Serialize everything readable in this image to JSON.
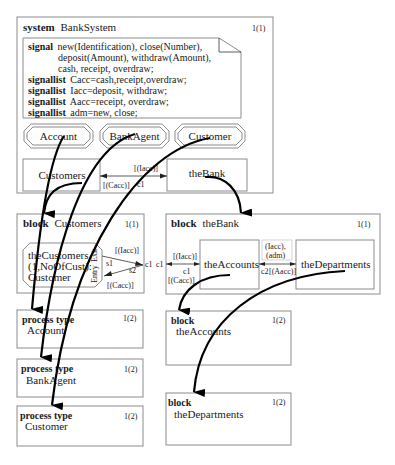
{
  "system": {
    "keyword": "system",
    "name": "BankSystem",
    "page": "1(1)",
    "signal_text": {
      "line1_kw": "signal",
      "line1": "new(Identification), close(Number),",
      "line2": "deposit(Amount), withdraw(Amount),",
      "line3": "cash, receipt, overdraw;",
      "line4_kw": "signallist",
      "line4": "Cacc=cash,receipt,overdraw;",
      "line5_kw": "signallist",
      "line5": "Iacc=deposit, withdraw;",
      "line6_kw": "signallist",
      "line6": "Aacc=receipt, overdraw;",
      "line7_kw": "signallist",
      "line7": "adm=new, close;"
    },
    "type_refs": [
      "Account",
      "BankAgent",
      "Customer"
    ],
    "blocks": [
      "Customers",
      "theBank"
    ],
    "channel": {
      "name": "c1",
      "top_label": "[(Iacc)]",
      "bottom_label": "[(Cacc)]"
    }
  },
  "block_customers": {
    "keyword": "block",
    "name": "Customers",
    "page": "1(1)",
    "process_line1": "theCustomers",
    "process_line2": "(1,NoOfCust):",
    "process_line3": "Customer",
    "gate_exit": "Exit",
    "gate_entry": "Entry",
    "route_s1": "s1",
    "route_s2": "s2",
    "label_iacc": "[(Iacc)]",
    "label_cacc": "[(Cacc)]",
    "channel_end": "c1"
  },
  "block_thebank": {
    "keyword": "block",
    "name": "theBank",
    "page": "1(1)",
    "channel_start": "c1",
    "c1_top": "[(Iacc)]",
    "c1_name": "c1",
    "c1_bottom": "[(Cacc)]",
    "sub_blocks": [
      "theAccounts",
      "theDepartments"
    ],
    "c2_top_line1": "(Iacc),",
    "c2_top_line2": "(adm)",
    "c2_name": "c2",
    "c2_bottom": "[(Aacc)]"
  },
  "process_types": [
    {
      "keyword": "process type",
      "name": "Account",
      "page": "1(2)"
    },
    {
      "keyword": "process type",
      "name": "BankAgent",
      "page": "1(2)"
    },
    {
      "keyword": "process type",
      "name": "Customer",
      "page": "1(2)"
    }
  ],
  "sub_blocks": [
    {
      "keyword": "block",
      "name": "theAccounts",
      "page": "1(2)"
    },
    {
      "keyword": "block",
      "name": "theDepartments",
      "page": "1(2)"
    }
  ]
}
